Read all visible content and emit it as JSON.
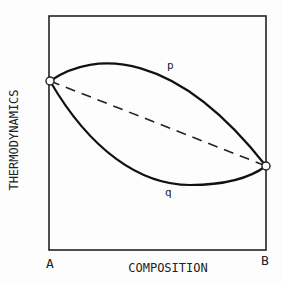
{
  "diagram": {
    "y_axis_label": "THERMODYNAMICS",
    "x_axis_label": "COMPOSITION",
    "left_endpoint_label": "A",
    "right_endpoint_label": "B",
    "upper_curve_label": "p",
    "lower_curve_label": "q",
    "colors": {
      "line": "#222222",
      "background": "#fdfdfd"
    }
  }
}
